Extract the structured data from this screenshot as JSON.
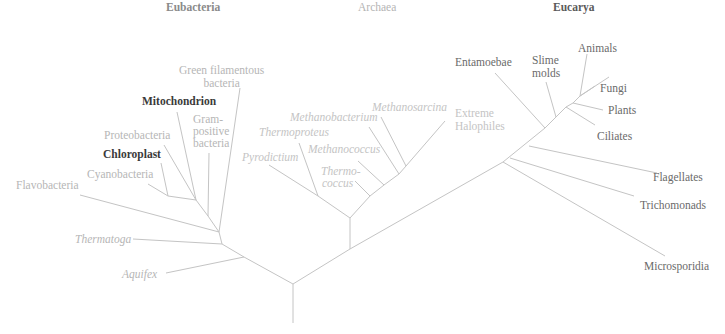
{
  "domains": {
    "eubacteria": "Eubacteria",
    "archaea": "Archaea",
    "eucarya": "Eucarya"
  },
  "eubacteria_taxa": {
    "green_filamentous_l1": "Green filamentous",
    "green_filamentous_l2": "bacteria",
    "mitochondrion": "Mitochondrion",
    "gram_positive_l1": "Gram-",
    "gram_positive_l2": "positive",
    "gram_positive_l3": "bacteria",
    "proteobacteria": "Proteobacteria",
    "chloroplast": "Chloroplast",
    "cyanobacteria": "Cyanobacteria",
    "flavobacteria": "Flavobacteria",
    "thermatoga": "Thermatoga",
    "aquifex": "Aquifex"
  },
  "archaea_taxa": {
    "methanosarcina": "Methanosarcina",
    "methanobacterium": "Methanobacterium",
    "thermoproteus": "Thermoproteus",
    "methanococcus": "Methanococcus",
    "pyrodictium": "Pyrodictium",
    "thermococcus_l1": "Thermo-",
    "thermococcus_l2": "coccus",
    "extreme_halophiles_l1": "Extreme",
    "extreme_halophiles_l2": "Halophiles"
  },
  "eucarya_taxa": {
    "entamoebae": "Entamoebae",
    "slime_molds_l1": "Slime",
    "slime_molds_l2": "molds",
    "animals": "Animals",
    "fungi": "Fungi",
    "plants": "Plants",
    "ciliates": "Ciliates",
    "flagellates": "Flagellates",
    "trichomonads": "Trichomonads",
    "microsporidia": "Microsporidia"
  },
  "colors": {
    "branch_line": "#c4c4c4",
    "highlight_text": "#3a3a3a",
    "eucarya_text": "#6a6a6a",
    "eubacteria_text": "#8e8e8e",
    "archaea_text": "#b6b6b6"
  }
}
